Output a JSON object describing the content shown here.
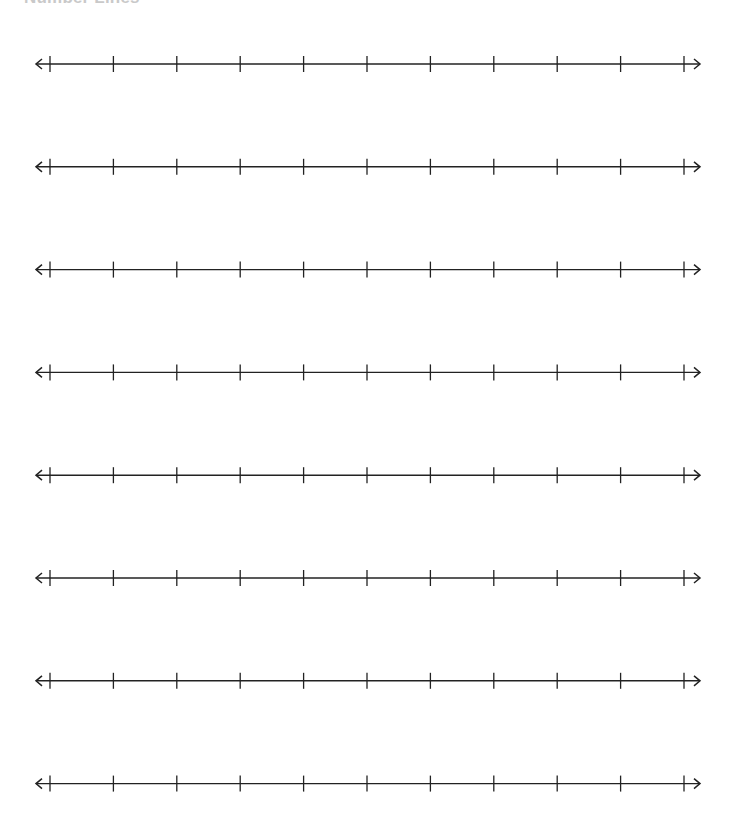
{
  "worksheet": {
    "title": "Number Lines",
    "number_lines": [
      {
        "id": 1,
        "tick_count": 11,
        "left_arrow": true,
        "right_arrow": true,
        "labels": []
      },
      {
        "id": 2,
        "tick_count": 11,
        "left_arrow": true,
        "right_arrow": true,
        "labels": []
      },
      {
        "id": 3,
        "tick_count": 11,
        "left_arrow": true,
        "right_arrow": true,
        "labels": []
      },
      {
        "id": 4,
        "tick_count": 11,
        "left_arrow": true,
        "right_arrow": true,
        "labels": []
      },
      {
        "id": 5,
        "tick_count": 11,
        "left_arrow": true,
        "right_arrow": true,
        "labels": []
      },
      {
        "id": 6,
        "tick_count": 11,
        "left_arrow": true,
        "right_arrow": true,
        "labels": []
      },
      {
        "id": 7,
        "tick_count": 11,
        "left_arrow": true,
        "right_arrow": true,
        "labels": []
      },
      {
        "id": 8,
        "tick_count": 11,
        "left_arrow": true,
        "right_arrow": true,
        "labels": []
      }
    ],
    "line_color": "#222222"
  }
}
